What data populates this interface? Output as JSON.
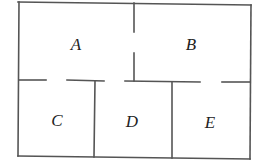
{
  "diagram": {
    "type": "floor-plan",
    "wall_color": "#555555",
    "label_color": "#222222",
    "rooms": [
      {
        "id": "A",
        "label": "A",
        "x": 76,
        "y": 44
      },
      {
        "id": "B",
        "label": "B",
        "x": 191,
        "y": 44
      },
      {
        "id": "C",
        "label": "C",
        "x": 57,
        "y": 120
      },
      {
        "id": "D",
        "label": "D",
        "x": 132,
        "y": 121
      },
      {
        "id": "E",
        "label": "E",
        "x": 210,
        "y": 122
      }
    ],
    "doorways": [
      {
        "between": [
          "A",
          "B"
        ]
      },
      {
        "between": [
          "A",
          "C"
        ]
      },
      {
        "between": [
          "A",
          "D"
        ]
      },
      {
        "between": [
          "B",
          "E"
        ]
      }
    ]
  }
}
